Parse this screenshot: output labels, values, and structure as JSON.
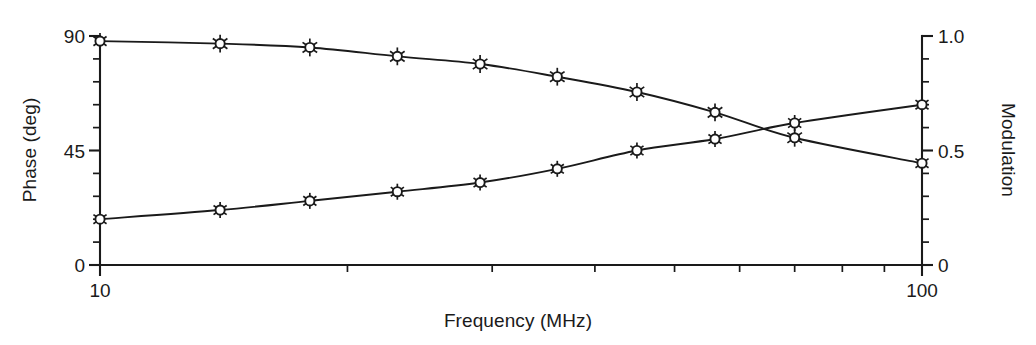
{
  "chart_data": {
    "type": "line",
    "title": "",
    "subtitle": "",
    "xlabel": "Frequency (MHz)",
    "ylabel": "Phase (deg)",
    "y2label": "Modulation",
    "xscale": "log",
    "xlim": [
      10,
      100
    ],
    "ylim": [
      0,
      90
    ],
    "y2lim": [
      0,
      1.0
    ],
    "grid": false,
    "legend": "none",
    "x_tick_labels": [
      "10",
      "100"
    ],
    "x_tick_values": [
      10,
      100
    ],
    "x_minor_ticks": [
      20,
      30,
      40,
      50,
      60,
      70,
      80,
      90
    ],
    "y_tick_labels": [
      "0",
      "45",
      "90"
    ],
    "y_tick_values": [
      0,
      45,
      90
    ],
    "y_minor_ticks": [
      9,
      18,
      27,
      36,
      54,
      63,
      72,
      81
    ],
    "y2_tick_labels": [
      "0",
      "0.5",
      "1.0"
    ],
    "y2_tick_values": [
      0,
      0.5,
      1.0
    ],
    "y2_minor_ticks": [
      0.1,
      0.2,
      0.3,
      0.4,
      0.6,
      0.7,
      0.8,
      0.9
    ],
    "marker_style": "open-circle-with-error-bars",
    "x": [
      10,
      14,
      18,
      23,
      29,
      36,
      45,
      56,
      70,
      100
    ],
    "series": [
      {
        "name": "Phase (deg)",
        "axis": "left",
        "values": [
          88.0,
          87.0,
          85.5,
          82.0,
          79.0,
          74.0,
          68.0,
          60.0,
          50.0,
          40.0
        ],
        "errors": [
          3.0,
          3.5,
          3.5,
          3.5,
          3.5,
          3.5,
          3.5,
          3.5,
          3.5,
          3.0
        ]
      },
      {
        "name": "Modulation",
        "axis": "right",
        "values": [
          0.2,
          0.24,
          0.28,
          0.32,
          0.36,
          0.42,
          0.5,
          0.55,
          0.62,
          0.7
        ],
        "errors": [
          0.035,
          0.035,
          0.035,
          0.035,
          0.035,
          0.035,
          0.035,
          0.035,
          0.035,
          0.03
        ]
      }
    ],
    "colors": {
      "axis": "#1a1a1a",
      "curve": "#1a1a1a",
      "marker_fill": "#ffffff",
      "background": "#ffffff"
    }
  },
  "labels": {
    "x_axis_title": "Frequency (MHz)",
    "y_left_axis_title": "Phase (deg)",
    "y_right_axis_title": "Modulation",
    "x_tick_low": "10",
    "x_tick_high": "100",
    "y_tick_0": "0",
    "y_tick_45": "45",
    "y_tick_90": "90",
    "y2_tick_0": "0",
    "y2_tick_half": "0.5",
    "y2_tick_one": "1.0"
  }
}
